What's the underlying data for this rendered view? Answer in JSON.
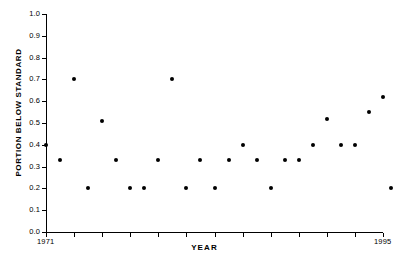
{
  "chart_data": {
    "type": "scatter",
    "title": "",
    "xlabel": "YEAR",
    "ylabel": "PORTION BELOW STANDARD",
    "xlim": [
      1971,
      1995
    ],
    "ylim": [
      0.0,
      1.0
    ],
    "grid": false,
    "legend": null,
    "marker": {
      "shape": "circle",
      "filled": true,
      "color": "#000000",
      "size_px": 4
    },
    "y_ticks": [
      {
        "value": 0.0,
        "label": "0.0"
      },
      {
        "value": 0.1,
        "label": "0.1"
      },
      {
        "value": 0.2,
        "label": "0.2"
      },
      {
        "value": 0.3,
        "label": "0.3"
      },
      {
        "value": 0.4,
        "label": "0.4"
      },
      {
        "value": 0.5,
        "label": "0.5"
      },
      {
        "value": 0.6,
        "label": "0.6"
      },
      {
        "value": 0.7,
        "label": "0.7"
      },
      {
        "value": 0.8,
        "label": "0.8"
      },
      {
        "value": 0.9,
        "label": "0.9"
      },
      {
        "value": 1.0,
        "label": "1.0"
      }
    ],
    "x_ticks": [
      {
        "value": 1971,
        "label": "1971"
      },
      {
        "value": 1973,
        "label": ""
      },
      {
        "value": 1975,
        "label": ""
      },
      {
        "value": 1977,
        "label": ""
      },
      {
        "value": 1979,
        "label": ""
      },
      {
        "value": 1981,
        "label": ""
      },
      {
        "value": 1983,
        "label": ""
      },
      {
        "value": 1985,
        "label": ""
      },
      {
        "value": 1987,
        "label": ""
      },
      {
        "value": 1989,
        "label": ""
      },
      {
        "value": 1991,
        "label": ""
      },
      {
        "value": 1993,
        "label": ""
      },
      {
        "value": 1995,
        "label": "1995"
      }
    ],
    "x": [
      1971,
      1972,
      1973,
      1974,
      1975,
      1976,
      1977,
      1978,
      1979,
      1980,
      1981,
      1982,
      1983,
      1984,
      1985,
      1986,
      1987,
      1988,
      1989,
      1990,
      1991,
      1992,
      1993,
      1994,
      1995
    ],
    "y": [
      0.4,
      0.33,
      0.7,
      0.2,
      0.51,
      0.33,
      0.2,
      0.2,
      0.33,
      0.7,
      0.2,
      0.33,
      0.2,
      0.33,
      0.4,
      0.33,
      0.2,
      0.33,
      0.33,
      0.4,
      0.52,
      0.4,
      0.4,
      0.55,
      0.62
    ],
    "points": [
      {
        "x": 1971,
        "y": 0.4
      },
      {
        "x": 1972,
        "y": 0.33
      },
      {
        "x": 1973,
        "y": 0.7
      },
      {
        "x": 1974,
        "y": 0.2
      },
      {
        "x": 1975,
        "y": 0.51
      },
      {
        "x": 1976,
        "y": 0.33
      },
      {
        "x": 1977,
        "y": 0.2
      },
      {
        "x": 1978,
        "y": 0.2
      },
      {
        "x": 1979,
        "y": 0.33
      },
      {
        "x": 1980,
        "y": 0.7
      },
      {
        "x": 1981,
        "y": 0.2
      },
      {
        "x": 1982,
        "y": 0.33
      },
      {
        "x": 1983,
        "y": 0.2
      },
      {
        "x": 1984,
        "y": 0.33
      },
      {
        "x": 1985,
        "y": 0.4
      },
      {
        "x": 1986,
        "y": 0.33
      },
      {
        "x": 1987,
        "y": 0.2
      },
      {
        "x": 1988,
        "y": 0.33
      },
      {
        "x": 1989,
        "y": 0.33
      },
      {
        "x": 1990,
        "y": 0.4
      },
      {
        "x": 1991,
        "y": 0.52
      },
      {
        "x": 1992,
        "y": 0.4
      },
      {
        "x": 1993,
        "y": 0.4
      },
      {
        "x": 1994,
        "y": 0.55
      },
      {
        "x": 1995,
        "y": 0.62
      },
      {
        "x": 1995.6,
        "y": 0.2
      }
    ]
  },
  "axes": {
    "y_title": "PORTION BELOW STANDARD",
    "x_title": "YEAR",
    "x_start_label": "1971",
    "x_end_label": "1995"
  },
  "geometry": {
    "plot_left_px": 46,
    "plot_right_px": 383,
    "plot_top_px": 14,
    "plot_bottom_px": 232
  }
}
